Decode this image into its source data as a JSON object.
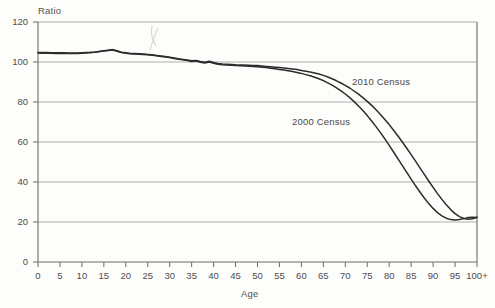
{
  "chart_data": {
    "type": "line",
    "title": "",
    "xlabel": "Age",
    "ylabel": "Ratio",
    "xlim": [
      0,
      100
    ],
    "ylim": [
      0,
      120
    ],
    "grid": true,
    "legend_position": "inline-annotation",
    "x_tick_labels": [
      "0",
      "5",
      "10",
      "15",
      "20",
      "25",
      "30",
      "35",
      "40",
      "45",
      "50",
      "55",
      "60",
      "65",
      "70",
      "75",
      "80",
      "85",
      "90",
      "95",
      "100+"
    ],
    "x_tick_values": [
      0,
      5,
      10,
      15,
      20,
      25,
      30,
      35,
      40,
      45,
      50,
      55,
      60,
      65,
      70,
      75,
      80,
      85,
      90,
      95,
      100
    ],
    "y_tick_labels": [
      "0",
      "20",
      "40",
      "60",
      "80",
      "100",
      "120"
    ],
    "y_tick_values": [
      0,
      20,
      40,
      60,
      80,
      100,
      120
    ],
    "x": [
      0,
      1,
      2,
      3,
      4,
      5,
      6,
      7,
      8,
      9,
      10,
      11,
      12,
      13,
      14,
      15,
      16,
      17,
      18,
      19,
      20,
      21,
      22,
      23,
      24,
      25,
      26,
      27,
      28,
      29,
      30,
      31,
      32,
      33,
      34,
      35,
      36,
      37,
      38,
      39,
      40,
      41,
      42,
      43,
      44,
      45,
      46,
      47,
      48,
      49,
      50,
      51,
      52,
      53,
      54,
      55,
      56,
      57,
      58,
      59,
      60,
      61,
      62,
      63,
      64,
      65,
      66,
      67,
      68,
      69,
      70,
      71,
      72,
      73,
      74,
      75,
      76,
      77,
      78,
      79,
      80,
      81,
      82,
      83,
      84,
      85,
      86,
      87,
      88,
      89,
      90,
      91,
      92,
      93,
      94,
      95,
      96,
      97,
      98,
      99,
      100
    ],
    "series": [
      {
        "name": "2010 Census",
        "label": "2010 Census",
        "color": "#2e2c2b",
        "values": [
          104.8,
          104.7,
          104.7,
          104.6,
          104.6,
          104.6,
          104.6,
          104.5,
          104.5,
          104.5,
          104.6,
          104.7,
          104.8,
          105.0,
          105.3,
          105.6,
          105.9,
          106.2,
          105.6,
          104.9,
          104.6,
          104.3,
          104.2,
          104.1,
          104.0,
          103.8,
          103.6,
          103.3,
          103.0,
          102.7,
          102.4,
          102.0,
          101.6,
          101.3,
          101.0,
          100.6,
          100.8,
          100.3,
          99.9,
          100.4,
          99.8,
          99.3,
          99.0,
          98.9,
          98.8,
          98.6,
          98.5,
          98.5,
          98.4,
          98.3,
          98.2,
          98.0,
          97.8,
          97.6,
          97.4,
          97.2,
          97.0,
          96.8,
          96.5,
          96.2,
          95.8,
          95.4,
          95.0,
          94.5,
          94.0,
          93.3,
          92.5,
          91.6,
          90.6,
          89.5,
          88.3,
          87.0,
          85.5,
          83.9,
          82.2,
          80.3,
          78.3,
          76.1,
          73.8,
          71.3,
          68.7,
          65.9,
          63.0,
          60.0,
          56.9,
          53.7,
          50.4,
          47.1,
          43.8,
          40.5,
          37.3,
          34.2,
          31.3,
          28.6,
          26.2,
          24.2,
          22.7,
          21.8,
          21.4,
          21.6,
          22.4
        ]
      },
      {
        "name": "2000 Census",
        "label": "2000 Census",
        "color": "#2e2c2b",
        "values": [
          104.5,
          104.4,
          104.4,
          104.4,
          104.3,
          104.3,
          104.3,
          104.3,
          104.3,
          104.3,
          104.4,
          104.5,
          104.7,
          104.9,
          105.2,
          105.5,
          105.8,
          106.0,
          105.4,
          104.7,
          104.4,
          104.1,
          104.0,
          103.9,
          103.8,
          103.6,
          103.4,
          103.1,
          102.8,
          102.5,
          102.2,
          101.8,
          101.4,
          101.1,
          100.7,
          100.3,
          100.5,
          99.9,
          99.5,
          100.0,
          99.4,
          98.9,
          98.6,
          98.5,
          98.4,
          98.2,
          98.1,
          98.0,
          97.9,
          97.8,
          97.6,
          97.4,
          97.2,
          96.9,
          96.6,
          96.3,
          96.0,
          95.6,
          95.2,
          94.8,
          94.3,
          93.7,
          93.1,
          92.4,
          91.6,
          90.7,
          89.6,
          88.4,
          87.1,
          85.6,
          84.0,
          82.2,
          80.2,
          78.0,
          75.7,
          73.2,
          70.5,
          67.7,
          64.7,
          61.6,
          58.3,
          55.0,
          51.6,
          48.2,
          44.8,
          41.4,
          38.1,
          35.0,
          32.0,
          29.2,
          26.8,
          24.7,
          23.1,
          21.9,
          21.2,
          21.0,
          21.2,
          21.7,
          22.3,
          22.4,
          22.3
        ]
      }
    ]
  }
}
